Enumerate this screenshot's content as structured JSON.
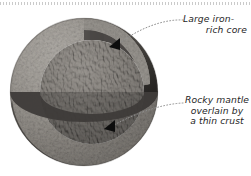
{
  "figure": {
    "background_color": "#ffffff",
    "top_rule": {
      "style": "dotted",
      "color": "#b9b9b9"
    },
    "planet": {
      "name": "planet-cutaway-sphere",
      "center_x": 84,
      "center_y": 92,
      "radius": 74,
      "layers": [
        {
          "name": "crust",
          "description": "thin crust",
          "color": "#b5b2ad",
          "shade_dark": "#4b4846",
          "shade_light": "#d8d5d0"
        },
        {
          "name": "mantle",
          "description": "rocky mantle",
          "color": "#4e4b48",
          "shade_dark": "#2a2826",
          "shade_light": "#7a7570"
        },
        {
          "name": "core",
          "description": "large iron-rich core",
          "color": "#6e6a65",
          "shade_dark": "#3a3835",
          "shade_light": "#c9c5bf"
        }
      ]
    },
    "leaders": [
      {
        "name": "leader-core",
        "style": "dotted",
        "color": "#8a8a8a",
        "from_x": 183,
        "from_y": 20,
        "to_x": 119,
        "to_y": 44
      },
      {
        "name": "leader-mantle",
        "style": "dotted",
        "color": "#8a8a8a",
        "from_x": 183,
        "from_y": 103,
        "to_x": 113,
        "to_y": 125
      }
    ],
    "arrows": [
      {
        "name": "arrow-core",
        "x": 116,
        "y": 44,
        "direction": "down-left",
        "color": "#111111"
      },
      {
        "name": "arrow-mantle",
        "x": 110,
        "y": 126,
        "direction": "down-left",
        "color": "#111111"
      }
    ],
    "labels": {
      "core": {
        "line1": "Large iron-",
        "line2": "rich core"
      },
      "mantle": {
        "line1": "Rocky mantle",
        "line2": "overlain by",
        "line3": "a thin crust"
      }
    }
  }
}
